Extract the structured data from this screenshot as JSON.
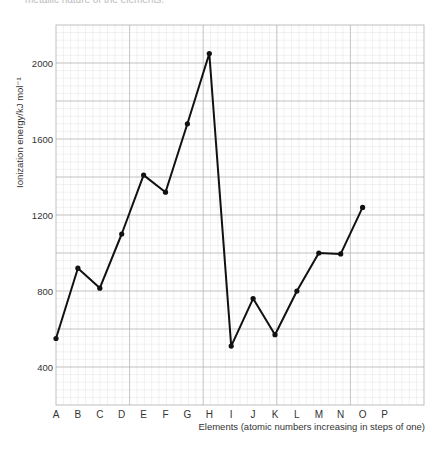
{
  "page": {
    "top_caption": "metallic nature of the elements."
  },
  "chart_data": {
    "type": "line",
    "title": "",
    "xlabel": "Elements (atomic numbers increasing in steps of one)",
    "ylabel": "Ionization energy/kJ mol⁻¹",
    "categories": [
      "A",
      "B",
      "C",
      "D",
      "E",
      "F",
      "G",
      "H",
      "I",
      "J",
      "K",
      "L",
      "M",
      "N",
      "O",
      "P"
    ],
    "series": [
      {
        "name": "First ionization energy",
        "values": [
          550,
          920,
          815,
          1100,
          1410,
          1320,
          1680,
          2050,
          510,
          760,
          570,
          800,
          1000,
          995,
          1240,
          null
        ]
      }
    ],
    "yticks": [
      400,
      800,
      1200,
      1600,
      2000
    ],
    "ylim": [
      200,
      2200
    ],
    "grid": true,
    "legend": "none",
    "colors": {
      "line": "#111111",
      "grid_major": "#b5b5b5",
      "grid_minor": "#e2e2e2",
      "text": "#333333"
    }
  }
}
